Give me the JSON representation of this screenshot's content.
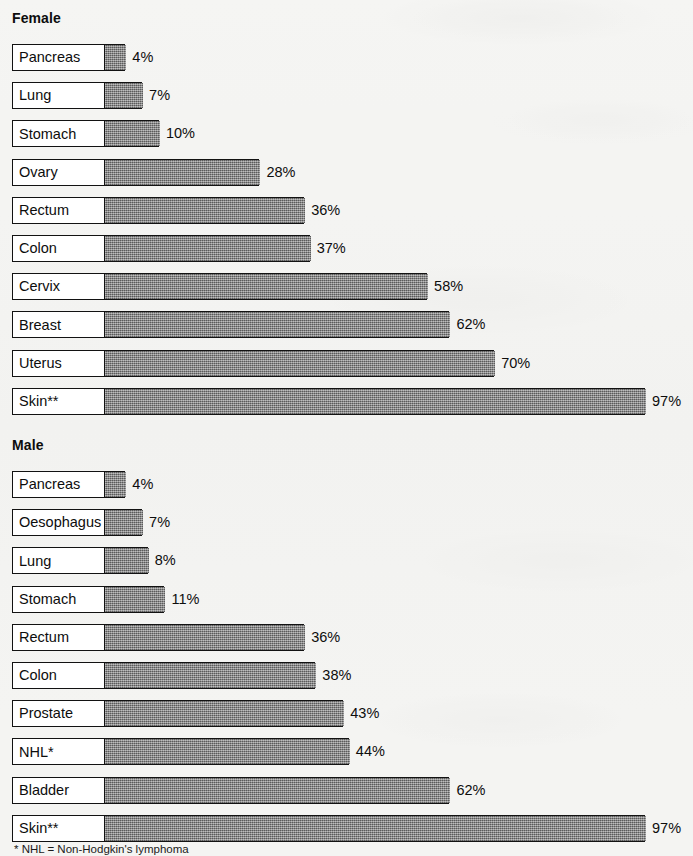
{
  "chart_data": {
    "type": "bar",
    "title": "",
    "orientation": "horizontal",
    "xlabel": "",
    "ylabel": "",
    "xlim": [
      0,
      100
    ],
    "grid": false,
    "legend": false,
    "value_suffix": "%",
    "groups": [
      {
        "name": "Female",
        "categories": [
          "Pancreas",
          "Lung",
          "Stomach",
          "Ovary",
          "Rectum",
          "Colon",
          "Cervix",
          "Breast",
          "Uterus",
          "Skin**"
        ],
        "values": [
          4,
          7,
          10,
          28,
          36,
          37,
          58,
          62,
          70,
          97
        ],
        "labels": [
          "4%",
          "7%",
          "10%",
          "28%",
          "36%",
          "37%",
          "58%",
          "62%",
          "70%",
          "97%"
        ]
      },
      {
        "name": "Male",
        "categories": [
          "Pancreas",
          "Oesophagus",
          "Lung",
          "Stomach",
          "Rectum",
          "Colon",
          "Prostate",
          "NHL*",
          "Bladder",
          "Skin**"
        ],
        "values": [
          4,
          7,
          8,
          11,
          36,
          38,
          43,
          44,
          62,
          97
        ],
        "labels": [
          "4%",
          "7%",
          "8%",
          "11%",
          "36%",
          "38%",
          "43%",
          "44%",
          "62%",
          "97%"
        ]
      }
    ],
    "annotations": [
      "* NHL = Non-Hodgkin's lymphoma"
    ]
  },
  "headings": {
    "female": "Female",
    "male": "Male"
  },
  "footnote": {
    "nhl": "* NHL = Non-Hodgkin's lymphoma"
  },
  "colors": {
    "bar_fill": "#7f7f7f",
    "bar_border": "#121212",
    "label_background": "#ffffff",
    "page_background": "#f4f4f2",
    "text": "#0d0d0d"
  }
}
